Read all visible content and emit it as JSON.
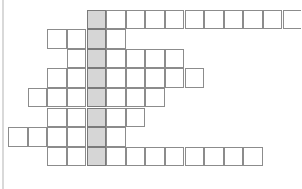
{
  "puzzle": {
    "type": "crossword-skeleton",
    "title": "",
    "cell_size": 19.6,
    "rows_count": 8,
    "columns_count": 13,
    "highlight_column_index": 5,
    "colors": {
      "cell_border": "#8c8c8c",
      "highlight_fill": "#d6d6d6",
      "highlight_border": "#7a7a7a",
      "background": "#ffffff",
      "margin_rule": "#d9d9d9"
    },
    "margin_rule": {
      "x": 2,
      "visible": true
    },
    "origin": {
      "x": -11.5,
      "y": 9.5
    },
    "rows": [
      {
        "index": 1,
        "start_column": 5,
        "length": 12,
        "letters": [
          "",
          "",
          "",
          "",
          "",
          "",
          "",
          "",
          "",
          "",
          "",
          ""
        ]
      },
      {
        "index": 2,
        "start_column": 3,
        "length": 4,
        "letters": [
          "",
          "",
          "",
          ""
        ]
      },
      {
        "index": 3,
        "start_column": 4,
        "length": 6,
        "letters": [
          "",
          "",
          "",
          "",
          "",
          ""
        ]
      },
      {
        "index": 4,
        "start_column": 3,
        "length": 8,
        "letters": [
          "",
          "",
          "",
          "",
          "",
          "",
          "",
          ""
        ]
      },
      {
        "index": 5,
        "start_column": 2,
        "length": 7,
        "letters": [
          "",
          "",
          "",
          "",
          "",
          "",
          ""
        ]
      },
      {
        "index": 6,
        "start_column": 3,
        "length": 5,
        "letters": [
          "",
          "",
          "",
          "",
          ""
        ]
      },
      {
        "index": 7,
        "start_column": 1,
        "length": 6,
        "letters": [
          "",
          "",
          "",
          "",
          "",
          ""
        ]
      },
      {
        "index": 8,
        "start_column": 3,
        "length": 11,
        "letters": [
          "",
          "",
          "",
          "",
          "",
          "",
          "",
          "",
          "",
          "",
          ""
        ]
      }
    ]
  }
}
